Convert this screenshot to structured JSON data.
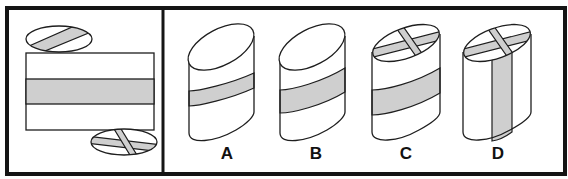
{
  "colors": {
    "stroke": "#1e1e1e",
    "frame": "#151515",
    "band_fill": "#cfcfcf",
    "surface_fill": "#ffffff"
  },
  "question_panel": {
    "description": "Unfolded net of a cylinder: rectangle side with horizontal gray band, top ellipse with diagonal stripe, bottom ellipse with X cross",
    "net": {
      "side": "rectangle-with-horizontal-band",
      "top_cap": "single-diagonal-stripe",
      "bottom_cap": "x-cross"
    }
  },
  "options": [
    {
      "label": "A",
      "top_cap": "plain",
      "side": "thin horizontal band"
    },
    {
      "label": "B",
      "top_cap": "plain",
      "side": "wide horizontal band"
    },
    {
      "label": "C",
      "top_cap": "cross",
      "side": "wide horizontal band"
    },
    {
      "label": "D",
      "top_cap": "cross",
      "side": "vertical band"
    }
  ]
}
